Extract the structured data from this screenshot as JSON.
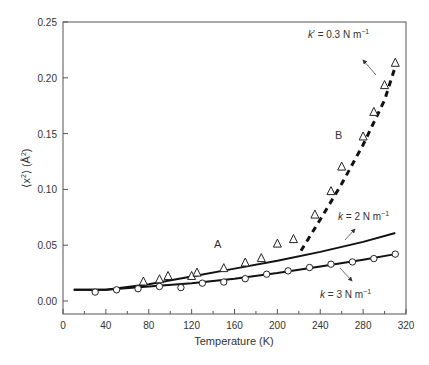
{
  "chart_data": {
    "type": "scatter",
    "title": "",
    "xlabel": "Temperature (K)",
    "ylabel": "⟨x²⟩ (Å²)",
    "xlim": [
      0,
      320
    ],
    "ylim": [
      0,
      0.25
    ],
    "xticks": [
      "0",
      "40",
      "80",
      "120",
      "160",
      "200",
      "240",
      "280",
      "320"
    ],
    "yticks": [
      "0.00",
      "0.05",
      "0.10",
      "0.15",
      "0.20",
      "0.25"
    ],
    "grid": false,
    "series": [
      {
        "name": "circles (k = 3 N m⁻¹)",
        "marker": "circle",
        "x": [
          30,
          50,
          70,
          90,
          110,
          130,
          150,
          170,
          190,
          210,
          230,
          250,
          270,
          290,
          310
        ],
        "y": [
          0.008,
          0.01,
          0.011,
          0.013,
          0.012,
          0.016,
          0.017,
          0.02,
          0.024,
          0.027,
          0.03,
          0.033,
          0.035,
          0.038,
          0.042
        ]
      },
      {
        "name": "triangles",
        "marker": "triangle",
        "x": [
          75,
          90,
          98,
          120,
          125,
          150,
          170,
          185,
          200,
          215,
          235,
          250,
          260,
          280,
          290,
          300,
          310
        ],
        "y": [
          0.017,
          0.019,
          0.022,
          0.022,
          0.025,
          0.029,
          0.034,
          0.038,
          0.051,
          0.055,
          0.077,
          0.098,
          0.12,
          0.147,
          0.169,
          0.193,
          0.213
        ]
      },
      {
        "name": "fit A (k = 2 N m⁻¹)",
        "line": "solid",
        "x": [
          10,
          40,
          80,
          120,
          160,
          200,
          240,
          280,
          310
        ],
        "y": [
          0.01,
          0.01,
          0.015,
          0.022,
          0.029,
          0.036,
          0.044,
          0.053,
          0.061
        ]
      },
      {
        "name": "fit (k = 3 N m⁻¹)",
        "line": "solid",
        "x": [
          10,
          40,
          80,
          120,
          160,
          200,
          240,
          280,
          310
        ],
        "y": [
          0.01,
          0.01,
          0.013,
          0.016,
          0.02,
          0.025,
          0.031,
          0.037,
          0.042
        ]
      },
      {
        "name": "fit B (k' = 0.3 N m⁻¹)",
        "line": "dashed",
        "x": [
          222,
          240,
          260,
          280,
          300,
          310
        ],
        "y": [
          0.045,
          0.073,
          0.105,
          0.14,
          0.18,
          0.21
        ]
      }
    ],
    "annotations": [
      {
        "text": "A",
        "x": 132,
        "y": 0.05
      },
      {
        "text": "B",
        "x": 250,
        "y": 0.155
      },
      {
        "text": "k' = 0.3 N m⁻¹",
        "x": 270,
        "y": 0.235
      },
      {
        "text": "k = 2 N m⁻¹",
        "x": 275,
        "y": 0.075
      },
      {
        "text": "k = 3 N m⁻¹",
        "x": 275,
        "y": -0.003
      }
    ]
  },
  "labels": {
    "xlabel": "Temperature (K)",
    "ylabel_x": "⟨x",
    "ylabel_rest": "⟩ (Å",
    "ylabel_end": ")",
    "sup2": "2",
    "label_A": "A",
    "label_B": "B",
    "k_prime_k": "k",
    "k_prime_mark": "′",
    "k_prime_rest": " = 0.3 N m",
    "k2_k": "k",
    "k2_rest": " = 2 N m",
    "k3_k": "k",
    "k3_rest": " = 3 N m",
    "sup_minus1": "−1"
  }
}
